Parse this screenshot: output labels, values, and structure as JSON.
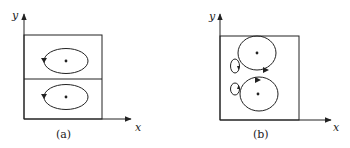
{
  "figure": {
    "panels": [
      {
        "id": "a",
        "caption": "(a)",
        "axes": {
          "x_label": "x",
          "y_label": "y"
        },
        "description": "Box split horizontally into two cells, each containing an elliptical orbit around a central point with counter-clockwise arrow on the left side",
        "orbits": [
          {
            "shape": "ellipse",
            "cell": "upper",
            "direction": "counter-clockwise",
            "center_dot": true
          },
          {
            "shape": "ellipse",
            "cell": "lower",
            "direction": "counter-clockwise",
            "center_dot": true
          }
        ]
      },
      {
        "id": "b",
        "caption": "(b)",
        "axes": {
          "x_label": "x",
          "y_label": "y"
        },
        "description": "Single box with two large orbits around central points and two small loops to the left",
        "orbits": [
          {
            "shape": "large-loop",
            "position": "upper",
            "direction": "clockwise",
            "center_dot": true
          },
          {
            "shape": "large-loop",
            "position": "lower",
            "direction": "clockwise",
            "center_dot": true
          },
          {
            "shape": "small-loop",
            "position": "upper-left",
            "direction": "clockwise",
            "center_dot": false
          },
          {
            "shape": "small-loop",
            "position": "lower-left",
            "direction": "clockwise",
            "center_dot": false
          }
        ]
      }
    ],
    "colors": {
      "stroke": "#222222",
      "background": "#ffffff"
    }
  }
}
